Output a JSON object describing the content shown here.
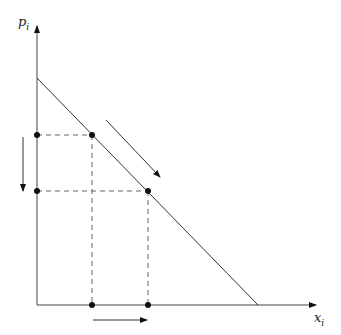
{
  "diagram": {
    "title": "",
    "y_axis": {
      "label": "p",
      "subscript": "i"
    },
    "x_axis": {
      "label": "x",
      "subscript": "i"
    },
    "demand_line": {
      "from": [
        37,
        78
      ],
      "to": [
        258,
        305
      ]
    },
    "points": [
      {
        "name": "initial",
        "x": 92,
        "y": 135
      },
      {
        "name": "final",
        "x": 148,
        "y": 191
      }
    ],
    "arrows": [
      {
        "name": "along-curve",
        "direction": "down-right"
      },
      {
        "name": "price-decrease",
        "direction": "down"
      },
      {
        "name": "quantity-increase",
        "direction": "right"
      }
    ],
    "colors": {
      "line": "#333333",
      "dash": "#555555",
      "point": "#111111"
    }
  }
}
